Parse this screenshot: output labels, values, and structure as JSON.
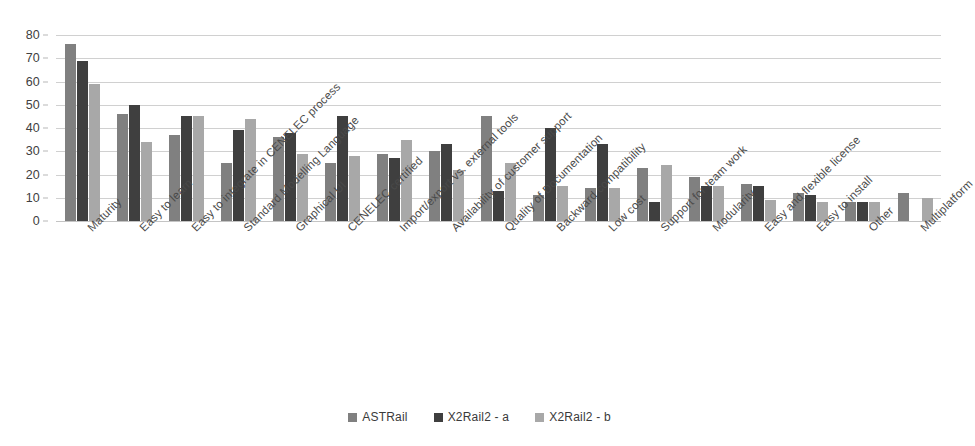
{
  "chart_data": {
    "type": "bar",
    "title": "",
    "xlabel": "",
    "ylabel": "",
    "ylim": [
      0,
      80
    ],
    "ytick_step": 10,
    "yticks": [
      80,
      70,
      60,
      50,
      40,
      30,
      20,
      10,
      0
    ],
    "grid": true,
    "legend_position": "bottom",
    "categories": [
      "Maturity",
      "Easy to learn",
      "Easy to integrate in CENELEC process",
      "Standard Modelling Language",
      "Graphical UI",
      "CENELEC certified",
      "Import/export vs. external tools",
      "Availability of customer support",
      "Quality of Documentation",
      "Backward compatibility",
      "Low cost",
      "Support for team work",
      "Modularity",
      "Easy and flexible license",
      "Easy to install",
      "Other",
      "Multiplatform"
    ],
    "series": [
      {
        "name": "ASTRail",
        "color": "#808080",
        "values": [
          76,
          46,
          37,
          25,
          36,
          25,
          29,
          30,
          45,
          11,
          14,
          23,
          19,
          16,
          12,
          8,
          12
        ]
      },
      {
        "name": "X2Rail2 - a",
        "color": "#3f3f3f",
        "values": [
          69,
          50,
          45,
          39,
          38,
          45,
          27,
          33,
          13,
          40,
          33,
          8,
          15,
          15,
          11,
          8,
          null
        ]
      },
      {
        "name": "X2Rail2 - b",
        "color": "#a8a8a8",
        "values": [
          59,
          34,
          45,
          44,
          29,
          28,
          35,
          22,
          25,
          15,
          14,
          24,
          15,
          9,
          8,
          8,
          10
        ]
      }
    ]
  },
  "legend": {
    "items": [
      {
        "label": "ASTRail",
        "color": "#808080",
        "swatch_icon": "square-swatch-icon"
      },
      {
        "label": "X2Rail2 - a",
        "color": "#3f3f3f",
        "swatch_icon": "square-swatch-icon"
      },
      {
        "label": "X2Rail2 - b",
        "color": "#a8a8a8",
        "swatch_icon": "square-swatch-icon"
      }
    ]
  }
}
